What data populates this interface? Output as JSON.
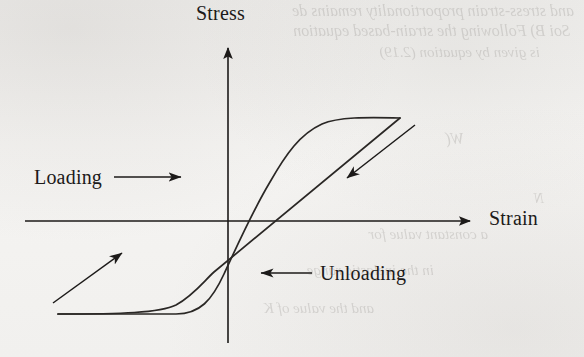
{
  "figure": {
    "kind": "stress-strain-hysteresis-loop",
    "axes": {
      "y_axis_label": "Stress",
      "x_axis_label": "Strain"
    },
    "annotations": {
      "loading_label": "Loading",
      "unloading_label": "Unloading"
    },
    "colors": {
      "ink": "#1c1a19",
      "curve": "#2a2725",
      "paper": "#f3f2f0",
      "bleed_text": "#6e6a66"
    }
  },
  "background_bleed": {
    "lines": [
      {
        "text": "and stress-strain proportionality remains de",
        "left": 10,
        "top": 2,
        "size": 16
      },
      {
        "text": "Soi      B) Following the strain-based equation",
        "left": 14,
        "top": 22,
        "size": 16
      },
      {
        "text": "is given by equation (2.19)",
        "left": 44,
        "top": 44,
        "size": 15
      },
      {
        "text": "W(",
        "left": 120,
        "top": 130,
        "size": 16
      },
      {
        "text": "a constant value for",
        "left": 96,
        "top": 226,
        "size": 15
      },
      {
        "text": "in the inelastic range",
        "left": 150,
        "top": 262,
        "size": 15
      },
      {
        "text": "and the value of K",
        "left": 210,
        "top": 300,
        "size": 15
      },
      {
        "text": "N",
        "left": 40,
        "top": 190,
        "size": 15
      }
    ]
  },
  "chart_data": {
    "type": "line",
    "title": "",
    "xlabel": "Strain",
    "ylabel": "Stress",
    "grid": false,
    "legend": null,
    "series": [
      {
        "name": "Loading branch",
        "direction": "up-right",
        "points": [
          {
            "x": 58,
            "y": 314
          },
          {
            "x": 140,
            "y": 314
          },
          {
            "x": 190,
            "y": 312
          },
          {
            "x": 218,
            "y": 296
          },
          {
            "x": 236,
            "y": 262
          },
          {
            "x": 262,
            "y": 212
          },
          {
            "x": 288,
            "y": 166
          },
          {
            "x": 312,
            "y": 136
          },
          {
            "x": 342,
            "y": 120
          },
          {
            "x": 400,
            "y": 118
          }
        ]
      },
      {
        "name": "Unloading branch",
        "direction": "down-left",
        "points": [
          {
            "x": 400,
            "y": 118
          },
          {
            "x": 300,
            "y": 200
          },
          {
            "x": 240,
            "y": 250
          },
          {
            "x": 200,
            "y": 284
          },
          {
            "x": 180,
            "y": 300
          },
          {
            "x": 150,
            "y": 310
          },
          {
            "x": 100,
            "y": 314
          },
          {
            "x": 58,
            "y": 314
          }
        ]
      }
    ],
    "axis_geometry": {
      "origin": {
        "x": 228,
        "y": 221
      },
      "x_axis": {
        "from_x": 25,
        "to_x": 477,
        "y": 221
      },
      "y_axis": {
        "x": 228,
        "from_y": 343,
        "to_y": 40
      }
    },
    "direction_arrows": [
      {
        "name": "loading-direction-arrow",
        "from": {
          "x": 53,
          "y": 303
        },
        "to": {
          "x": 128,
          "y": 248
        }
      },
      {
        "name": "unloading-direction-arrow",
        "from": {
          "x": 413,
          "y": 126
        },
        "to": {
          "x": 340,
          "y": 183
        }
      }
    ],
    "pointer_arrows": [
      {
        "name": "loading-pointer",
        "from": {
          "x": 116,
          "y": 177
        },
        "to": {
          "x": 188,
          "y": 177
        }
      },
      {
        "name": "unloading-pointer",
        "from": {
          "x": 310,
          "y": 273
        },
        "to": {
          "x": 254,
          "y": 273
        }
      }
    ]
  }
}
